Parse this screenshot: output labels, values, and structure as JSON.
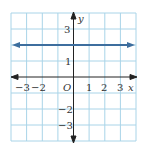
{
  "graph": {
    "x_label": "x",
    "y_label": "y",
    "origin_label": "O",
    "x_ticks": [
      {
        "label": "−3",
        "value": -3
      },
      {
        "label": "−2",
        "value": -2
      },
      {
        "label": "1",
        "value": 1
      },
      {
        "label": "2",
        "value": 2
      },
      {
        "label": "3",
        "value": 3
      }
    ],
    "y_ticks": [
      {
        "label": "3",
        "value": 3
      },
      {
        "label": "1",
        "value": 1
      },
      {
        "label": "−2",
        "value": -2
      },
      {
        "label": "−3",
        "value": -3
      }
    ],
    "line": {
      "equation": "y = 2",
      "color": "#3d6e9e"
    },
    "grid_color": "#a9d4e8",
    "axis_color": "#222222",
    "x_range": [
      -4,
      4
    ],
    "y_range": [
      -4,
      4
    ]
  }
}
